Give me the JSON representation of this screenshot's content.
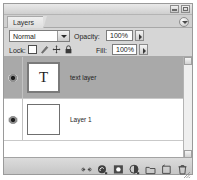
{
  "window": {
    "buttons": [
      {
        "name": "minimize-button",
        "label": "Minimize"
      },
      {
        "name": "close-button",
        "label": "Close"
      }
    ]
  },
  "panel": {
    "tab_label": "Layers",
    "menu_button_label": "Panel menu"
  },
  "blend": {
    "mode_value": "Normal",
    "mode_options": [
      "Normal",
      "Dissolve",
      "Multiply",
      "Screen",
      "Overlay"
    ],
    "opacity_label": "Opacity:",
    "opacity_value": "100%"
  },
  "lock": {
    "label": "Lock:",
    "icons": [
      {
        "name": "lock-transparent-pixels-icon",
        "title": "Lock transparent pixels"
      },
      {
        "name": "lock-image-pixels-icon",
        "title": "Lock image pixels"
      },
      {
        "name": "lock-position-icon",
        "title": "Lock position"
      },
      {
        "name": "lock-all-icon",
        "title": "Lock all"
      }
    ],
    "fill_label": "Fill:",
    "fill_value": "100%"
  },
  "layers": [
    {
      "name": "text layer",
      "thumb_type": "text",
      "thumb_glyph": "T",
      "visible": true,
      "selected": true
    },
    {
      "name": "Layer 1",
      "thumb_type": "raster",
      "thumb_glyph": "",
      "visible": true,
      "selected": false
    }
  ],
  "bottom_tools": [
    {
      "name": "link-layers-button",
      "label": "Link layers"
    },
    {
      "name": "add-layer-style-button",
      "label": "Add a layer style"
    },
    {
      "name": "add-layer-mask-button",
      "label": "Add layer mask"
    },
    {
      "name": "new-fill-adjustment-layer-button",
      "label": "Create new fill or adjustment layer"
    },
    {
      "name": "new-group-button",
      "label": "Create a new group"
    },
    {
      "name": "new-layer-button",
      "label": "Create a new layer"
    },
    {
      "name": "delete-layer-button",
      "label": "Delete layer"
    }
  ],
  "colors": {
    "panel_bg": "#d6d6d6",
    "list_bg": "#ffffff",
    "selected_row": "#a9a9a9",
    "text": "#1c1c1c"
  }
}
